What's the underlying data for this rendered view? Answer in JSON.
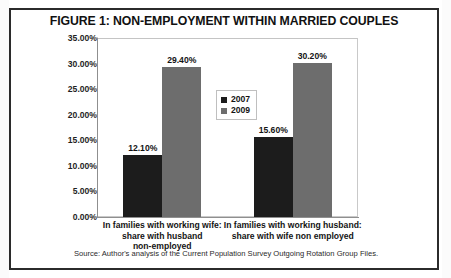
{
  "figure": {
    "title": "FIGURE 1: NON-EMPLOYMENT WITHIN MARRIED COUPLES",
    "source": "Source: Author's analysis of the Current Population Survey Outgoing Rotation Group Files."
  },
  "colors": {
    "series_2007": "#1c1c1c",
    "series_2009": "#6d6d6d",
    "frame": "#2b2b2b",
    "axis": "#8f8f8f",
    "plot_border": "#c9c9c9"
  },
  "chart_data": {
    "type": "bar",
    "title": "FIGURE 1: NON-EMPLOYMENT WITHIN MARRIED COUPLES",
    "xlabel": "",
    "ylabel": "",
    "categories": [
      "In families with working wife: share with husband non-employed",
      "In families with working husband: share with wife non employed"
    ],
    "category_lines": [
      [
        "In families with working wife:",
        "share with husband",
        "non-employed"
      ],
      [
        "In families with working husband:",
        "share with wife non employed"
      ]
    ],
    "series": [
      {
        "name": "2007",
        "color": "#1c1c1c",
        "values": [
          12.1,
          15.6
        ],
        "labels": [
          "12.10%",
          "15.60%"
        ]
      },
      {
        "name": "2009",
        "color": "#6d6d6d",
        "values": [
          29.4,
          30.2
        ],
        "labels": [
          "29.40%",
          "30.20%"
        ]
      }
    ],
    "ylim": [
      0,
      35
    ],
    "ytick_values": [
      0,
      5,
      10,
      15,
      20,
      25,
      30,
      35
    ],
    "ytick_labels": [
      "0.00%",
      "5.00%",
      "10.00%",
      "15.00%",
      "20.00%",
      "25.00%",
      "30.00%",
      "35.00%"
    ],
    "grid": false,
    "legend": {
      "position": "inside-upper-center",
      "entries": [
        "2007",
        "2009"
      ]
    }
  }
}
